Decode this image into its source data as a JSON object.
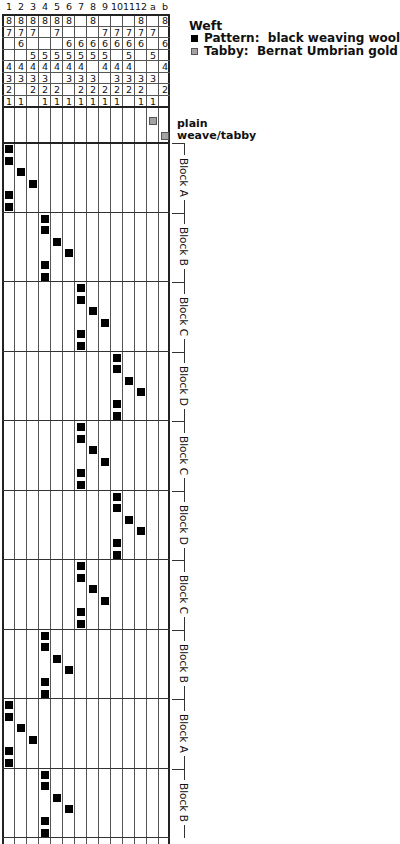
{
  "draft": {
    "columns": [
      "1",
      "2",
      "3",
      "4",
      "5",
      "6",
      "7",
      "8",
      "9",
      "10",
      "11",
      "12",
      "a",
      "b"
    ],
    "tieup": [
      {
        "shaft": "8",
        "cells": [
          "8",
          "8",
          "8",
          "8",
          "8",
          "8",
          "",
          "8",
          "",
          "",
          "",
          "8",
          "",
          "8"
        ]
      },
      {
        "shaft": "7",
        "cells": [
          "7",
          "7",
          "7",
          "",
          "7",
          "",
          "",
          "",
          "7",
          "7",
          "7",
          "7",
          "7",
          ""
        ]
      },
      {
        "shaft": "6",
        "cells": [
          "",
          "6",
          "",
          "",
          "",
          "6",
          "6",
          "6",
          "6",
          "6",
          "6",
          "6",
          "",
          "6"
        ]
      },
      {
        "shaft": "5",
        "cells": [
          "",
          "",
          "5",
          "5",
          "5",
          "5",
          "5",
          "5",
          "5",
          "",
          "5",
          "",
          "5",
          ""
        ]
      },
      {
        "shaft": "4",
        "cells": [
          "4",
          "4",
          "4",
          "4",
          "4",
          "4",
          "4",
          "",
          "4",
          "4",
          "4",
          "",
          "",
          "4"
        ]
      },
      {
        "shaft": "3",
        "cells": [
          "3",
          "3",
          "3",
          "3",
          "",
          "3",
          "3",
          "3",
          "",
          "3",
          "3",
          "3",
          "3",
          ""
        ]
      },
      {
        "shaft": "2",
        "cells": [
          "2",
          "",
          "2",
          "2",
          "2",
          "",
          "2",
          "2",
          "2",
          "2",
          "2",
          "2",
          "",
          "2"
        ]
      },
      {
        "shaft": "1",
        "cells": [
          "1",
          "1",
          "",
          "1",
          "1",
          "1",
          "1",
          "1",
          "1",
          "1",
          "",
          "1",
          "1",
          ""
        ]
      }
    ],
    "tabby": {
      "label": "plain weave/tabby",
      "label_line1": "plain",
      "label_line2": "weave/tabby",
      "treadles": [
        "a",
        "b"
      ],
      "color": "#a3a3a3"
    },
    "blocks_definition": {
      "A": [
        1,
        1,
        2,
        3,
        1,
        1
      ],
      "B": [
        4,
        4,
        5,
        6,
        4,
        4
      ],
      "C": [
        7,
        7,
        8,
        9,
        7,
        7
      ],
      "D": [
        10,
        10,
        11,
        12,
        10,
        10
      ]
    },
    "treadling_sequence": [
      {
        "block": "A",
        "label": "Block A"
      },
      {
        "block": "B",
        "label": "Block B"
      },
      {
        "block": "C",
        "label": "Block C"
      },
      {
        "block": "D",
        "label": "Block D"
      },
      {
        "block": "C",
        "label": "Block C"
      },
      {
        "block": "D",
        "label": "Block D"
      },
      {
        "block": "C",
        "label": "Block C"
      },
      {
        "block": "B",
        "label": "Block B"
      },
      {
        "block": "A",
        "label": "Block A"
      },
      {
        "block": "B",
        "label": "Block B"
      }
    ]
  },
  "legend": {
    "title": "Weft",
    "items": [
      {
        "label": "Pattern:  black weaving wool",
        "color": "#000000"
      },
      {
        "label": "Tabby:  Bernat Umbrian gold",
        "color": "#a3a3a3"
      }
    ]
  }
}
